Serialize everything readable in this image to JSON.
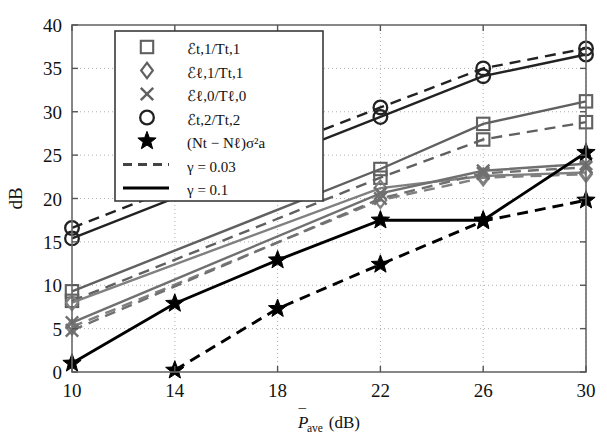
{
  "figure": {
    "kind": "line-plot-with-markers",
    "background": "#ffffff",
    "frame_color": "#555555",
    "grid_color": "#aaaaaa"
  },
  "axes": {
    "xlabel": "P̄ave (dB)",
    "xlabel_parts": {
      "base": "P",
      "bar": "¯",
      "sub": "ave",
      "unit": "(dB)"
    },
    "ylabel": "dB",
    "xticks": [
      10,
      14,
      18,
      22,
      26,
      30
    ],
    "xticklabels": [
      "10",
      "14",
      "18",
      "22",
      "26",
      "30"
    ],
    "yticks": [
      0,
      5,
      10,
      15,
      20,
      25,
      30,
      35,
      40
    ],
    "yticklabels": [
      "0",
      "5",
      "10",
      "15",
      "20",
      "25",
      "30",
      "35",
      "40"
    ],
    "xlim": [
      10,
      30
    ],
    "ylim": [
      0,
      40
    ],
    "grid": "dotted-both"
  },
  "legend": {
    "position": "upper-left",
    "entries": [
      {
        "marker": "square-icon",
        "color": "#606060",
        "label": "ℰt,1/Tt,1"
      },
      {
        "marker": "diamond-icon",
        "color": "#606060",
        "label": "ℰℓ,1/Tt,1"
      },
      {
        "marker": "cross-icon",
        "color": "#606060",
        "label": "ℰℓ,0/Tℓ,0"
      },
      {
        "marker": "circle-icon",
        "color": "#222222",
        "label": "ℰt,2/Tt,2"
      },
      {
        "marker": "star-icon",
        "color": "#000000",
        "label": "(Nt − Nℓ)σ²a"
      },
      {
        "marker": "dashed-line-icon",
        "color": "#444444",
        "label": "γ = 0.03"
      },
      {
        "marker": "solid-line-icon",
        "color": "#000000",
        "label": "γ = 0.1"
      }
    ]
  },
  "chart_data": {
    "type": "line",
    "title": "",
    "xlabel": "P̄ave (dB)",
    "ylabel": "dB",
    "x": [
      10,
      14,
      18,
      22,
      26,
      30
    ],
    "xlim": [
      10,
      30
    ],
    "ylim": [
      0,
      40
    ],
    "grid": true,
    "legend_position": "upper-left",
    "series": [
      {
        "name": "ℰt,2/Tt,2 (γ = 0.1)",
        "marker": "circle",
        "linestyle": "solid",
        "color": "#222222",
        "values": [
          15.4,
          null,
          null,
          29.4,
          34.1,
          36.6
        ]
      },
      {
        "name": "ℰt,2/Tt,2 (γ = 0.03)",
        "marker": "circle",
        "linestyle": "dashed",
        "color": "#222222",
        "values": [
          16.6,
          null,
          null,
          30.5,
          35.0,
          37.3
        ]
      },
      {
        "name": "ℰt,1/Tt,1 (γ = 0.1)",
        "marker": "square",
        "linestyle": "solid",
        "color": "#606060",
        "values": [
          9.3,
          null,
          null,
          23.4,
          28.6,
          31.2
        ]
      },
      {
        "name": "ℰt,1/Tt,1 (γ = 0.03)",
        "marker": "square",
        "linestyle": "dashed",
        "color": "#606060",
        "values": [
          8.2,
          null,
          null,
          22.4,
          26.8,
          28.8
        ]
      },
      {
        "name": "ℰℓ,1/Tt,1 (γ = 0.1)",
        "marker": "diamond",
        "linestyle": "solid",
        "color": "#808080",
        "values": [
          8.0,
          null,
          null,
          21.2,
          22.6,
          23.0
        ]
      },
      {
        "name": "ℰℓ,1/Tt,1 (γ = 0.03)",
        "marker": "diamond",
        "linestyle": "dashed",
        "color": "#808080",
        "values": [
          5.2,
          null,
          null,
          19.8,
          22.4,
          22.8
        ]
      },
      {
        "name": "ℰℓ,0/Tℓ,0 (γ = 0.1)",
        "marker": "cross",
        "linestyle": "solid",
        "color": "#707070",
        "values": [
          5.7,
          null,
          null,
          20.6,
          23.2,
          24.0
        ]
      },
      {
        "name": "ℰℓ,0/Tℓ,0 (γ = 0.03)",
        "marker": "cross",
        "linestyle": "dashed",
        "color": "#707070",
        "values": [
          4.8,
          null,
          null,
          20.0,
          22.9,
          23.6
        ]
      },
      {
        "name": "(Nt − Nℓ)σ²a (γ = 0.1)",
        "marker": "star",
        "linestyle": "solid",
        "color": "#000000",
        "values": [
          1.0,
          7.9,
          12.9,
          17.5,
          17.5,
          25.3
        ]
      },
      {
        "name": "(Nt − Nℓ)σ²a (γ = 0.03)",
        "marker": "star",
        "linestyle": "dashed",
        "color": "#000000",
        "values": [
          null,
          0.2,
          7.3,
          12.4,
          17.4,
          19.8
        ]
      }
    ]
  }
}
